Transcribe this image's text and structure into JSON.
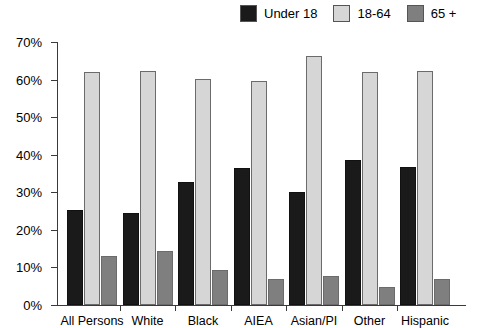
{
  "chart_data": {
    "type": "bar",
    "title": "",
    "subtitle": "",
    "xlabel": "",
    "ylabel": "",
    "ylim": [
      0,
      70
    ],
    "ytick_step": 10,
    "ytick_labels": [
      "0%",
      "10%",
      "20%",
      "30%",
      "40%",
      "50%",
      "60%",
      "70%"
    ],
    "ytick_values": [
      0,
      10,
      20,
      30,
      40,
      50,
      60,
      70
    ],
    "grid": false,
    "legend_position": "top-right",
    "value_suffix": "%",
    "categories": [
      "All Persons",
      "White",
      "Black",
      "AIEA",
      "Asian/PI",
      "Other",
      "Hispanic"
    ],
    "series": [
      {
        "name": "Under 18",
        "color": "#1a1a1a",
        "values": [
          25.3,
          24.5,
          32.8,
          36.5,
          30.1,
          38.6,
          36.7
        ]
      },
      {
        "name": "18-64",
        "color": "#d6d6d6",
        "values": [
          62.0,
          62.3,
          60.2,
          59.6,
          66.3,
          62.0,
          62.3
        ]
      },
      {
        "name": "65 +",
        "color": "#7f7f7f",
        "values": [
          13.0,
          14.4,
          9.3,
          7.0,
          7.7,
          4.8,
          6.9
        ]
      }
    ]
  },
  "legend": {
    "entries": [
      {
        "label": "Under 18",
        "color": "#1a1a1a"
      },
      {
        "label": "18-64",
        "color": "#d6d6d6"
      },
      {
        "label": "65 +",
        "color": "#7f7f7f"
      }
    ]
  },
  "axes": {
    "y": {
      "labels": [
        "70%",
        "60%",
        "50%",
        "40%",
        "30%",
        "20%",
        "10%",
        "0%"
      ]
    },
    "x": {
      "labels": [
        "All Persons",
        "White",
        "Black",
        "AIEA",
        "Asian/PI",
        "Other",
        "Hispanic"
      ]
    }
  }
}
